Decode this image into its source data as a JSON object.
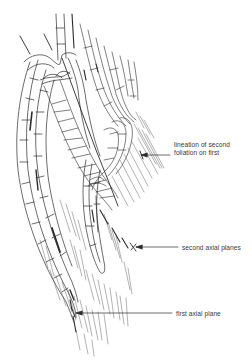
{
  "diagram": {
    "colors": {
      "line": "#2b2b2b",
      "background": "#ffffff",
      "text": "#3a3a3a"
    },
    "labels": {
      "lineation_line1": "lineation of second",
      "lineation_line2": "foliation on first",
      "second_axial_planes": "second axial planes",
      "first_axial_plane": "first axial plane"
    },
    "callouts": [
      {
        "id": "lineation",
        "arrow_from": [
          170,
          155
        ],
        "arrow_to": [
          140,
          155
        ]
      },
      {
        "id": "second_axial_planes",
        "arrow_from": [
          178,
          247
        ],
        "arrow_to": [
          136,
          247
        ]
      },
      {
        "id": "first_axial_plane",
        "arrow_from": [
          172,
          313
        ],
        "arrow_to": [
          75,
          313
        ]
      }
    ]
  }
}
